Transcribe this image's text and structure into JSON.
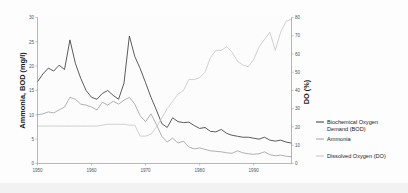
{
  "chart_data": {
    "type": "line",
    "title": "",
    "xlabel": "",
    "ylabel": "Ammonia, BOD (mg/l)",
    "y2label": "DO (%)",
    "xlim": [
      1950,
      1997
    ],
    "ylim": [
      0,
      30
    ],
    "y2lim": [
      0,
      80
    ],
    "grid": false,
    "legend_position": "right",
    "x_ticks": [
      "1950",
      "1960",
      "1970",
      "1980",
      "1990"
    ],
    "x_tick_values": [
      1950,
      1960,
      1970,
      1980,
      1990
    ],
    "y_ticks": [
      "0",
      "5",
      "10",
      "15",
      "20",
      "25",
      "30"
    ],
    "y_tick_values": [
      0,
      5,
      10,
      15,
      20,
      25,
      30
    ],
    "y2_ticks": [
      "0",
      "10",
      "20",
      "30",
      "40",
      "50",
      "60",
      "70",
      "80"
    ],
    "y2_tick_values": [
      0,
      10,
      20,
      30,
      40,
      50,
      60,
      70,
      80
    ],
    "x": [
      1950,
      1951,
      1952,
      1953,
      1954,
      1955,
      1956,
      1957,
      1958,
      1959,
      1960,
      1961,
      1962,
      1963,
      1964,
      1965,
      1966,
      1967,
      1968,
      1969,
      1970,
      1971,
      1972,
      1973,
      1974,
      1975,
      1976,
      1977,
      1978,
      1979,
      1980,
      1981,
      1982,
      1983,
      1984,
      1985,
      1986,
      1987,
      1988,
      1989,
      1990,
      1991,
      1992,
      1993,
      1994,
      1995,
      1996,
      1997
    ],
    "series": [
      {
        "name": "Biochemical Oxygen Demand (BOD)",
        "axis": "left",
        "color": "#4a4a4a",
        "values": [
          16.8,
          18.4,
          19.6,
          19.0,
          20.2,
          19.3,
          25.4,
          20.6,
          17.5,
          15.0,
          13.6,
          13.2,
          14.4,
          15.0,
          14.0,
          13.2,
          16.5,
          26.2,
          22.0,
          19.5,
          16.6,
          13.6,
          11.0,
          8.2,
          7.4,
          9.4,
          8.6,
          8.4,
          8.5,
          7.8,
          7.2,
          7.4,
          6.6,
          6.5,
          7.0,
          6.2,
          5.8,
          5.6,
          5.4,
          5.4,
          5.2,
          5.0,
          5.4,
          4.8,
          4.6,
          4.8,
          4.4,
          4.2
        ]
      },
      {
        "name": "Ammonia",
        "axis": "left",
        "color": "#a8a8a8",
        "values": [
          10.0,
          10.2,
          10.6,
          10.4,
          11.0,
          11.6,
          13.6,
          13.2,
          12.2,
          12.0,
          11.6,
          11.0,
          12.6,
          12.0,
          12.8,
          12.2,
          13.0,
          13.6,
          12.2,
          9.8,
          8.6,
          10.2,
          8.0,
          5.6,
          4.4,
          5.2,
          4.2,
          4.6,
          3.4,
          3.0,
          3.2,
          2.9,
          2.6,
          2.5,
          2.4,
          2.2,
          2.1,
          2.6,
          2.2,
          2.0,
          1.9,
          2.0,
          2.4,
          1.8,
          1.6,
          1.7,
          1.5,
          1.4
        ]
      },
      {
        "name": "Dissolved Oxygen (DO)",
        "axis": "right",
        "color": "#c9c9c9",
        "values": [
          20.5,
          20.5,
          20.5,
          20.5,
          20.5,
          20.5,
          20.5,
          20.5,
          20.5,
          20.5,
          20.5,
          20.5,
          21.0,
          21.5,
          21.5,
          21.5,
          21.5,
          21.0,
          21.0,
          15.0,
          15.0,
          16.0,
          20.0,
          25.0,
          30.0,
          34.0,
          38.0,
          40.0,
          46.0,
          46.0,
          47.0,
          50.0,
          58.0,
          62.0,
          62.0,
          64.0,
          61.0,
          56.0,
          54.0,
          53.0,
          57.0,
          64.0,
          68.0,
          72.0,
          62.0,
          72.0,
          78.0,
          79.0
        ]
      }
    ]
  },
  "legend": {
    "items": [
      {
        "label": "Biochemical Oxygen Demand (BOD)",
        "color": "#4a4a4a"
      },
      {
        "label": "Ammonia",
        "color": "#a8a8a8"
      },
      {
        "label": "Dissolved Oxygen (DO)",
        "color": "#c9c9c9"
      }
    ]
  }
}
